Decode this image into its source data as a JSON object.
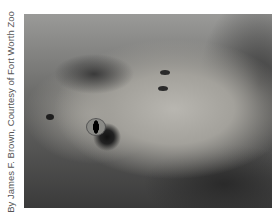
{
  "caption": "By James F. Brown, Courtesy of Fort Worth Zoo",
  "photo": {
    "subject": "close-up of a rattlesnake head",
    "tone": "grayscale"
  }
}
